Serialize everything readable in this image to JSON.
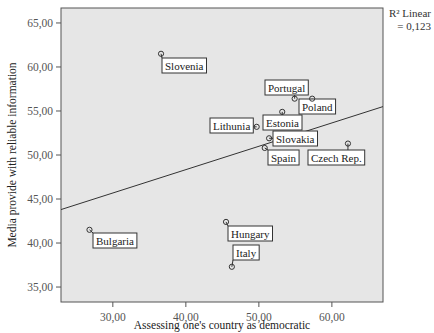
{
  "chart_data": {
    "type": "scatter",
    "title": "",
    "xlabel": "Assessing one's country as democratic",
    "ylabel": "Media provide with reliable information",
    "xlim": [
      22.9,
      67.0
    ],
    "ylim": [
      33.3,
      66.7
    ],
    "x_ticks": [
      30,
      40,
      50,
      60
    ],
    "x_tick_labels": [
      "30,00",
      "40,00",
      "50,00",
      "60,00"
    ],
    "y_ticks": [
      35,
      40,
      45,
      50,
      55,
      60,
      65
    ],
    "y_tick_labels": [
      "35,00",
      "40,00",
      "45,00",
      "50,00",
      "55,00",
      "60,00",
      "65,00"
    ],
    "grid": false,
    "background": "#e6e6e6",
    "points": [
      {
        "label": "Slovenia",
        "x": 36.6,
        "y": 61.5,
        "lx": 162,
        "ly": 58,
        "anchor": "tl"
      },
      {
        "label": "Portugal",
        "x": 54.9,
        "y": 56.4,
        "lx": 265,
        "ly": 80,
        "anchor": "tl"
      },
      {
        "label": "Poland",
        "x": 57.3,
        "y": 56.4,
        "lx": 299,
        "ly": 99,
        "anchor": "tl"
      },
      {
        "label": "Estonia",
        "x": 53.2,
        "y": 54.9,
        "lx": 263,
        "ly": 115,
        "anchor": "tl"
      },
      {
        "label": "Lithunia",
        "x": 49.7,
        "y": 53.2,
        "lx": 210,
        "ly": 118,
        "anchor": "tl"
      },
      {
        "label": "Slovakia",
        "x": 51.4,
        "y": 51.9,
        "lx": 273,
        "ly": 131,
        "anchor": "tl"
      },
      {
        "label": "Spain",
        "x": 50.8,
        "y": 50.8,
        "lx": 268,
        "ly": 150,
        "anchor": "tl"
      },
      {
        "label": "Czech Rep.",
        "x": 62.2,
        "y": 51.3,
        "lx": 308,
        "ly": 150,
        "anchor": "tl"
      },
      {
        "label": "Bulgaria",
        "x": 26.8,
        "y": 41.5,
        "lx": 93,
        "ly": 233,
        "anchor": "tl"
      },
      {
        "label": "Hungary",
        "x": 45.5,
        "y": 42.4,
        "lx": 228,
        "ly": 226,
        "anchor": "tl"
      },
      {
        "label": "Italy",
        "x": 46.3,
        "y": 37.3,
        "lx": 233,
        "ly": 245,
        "anchor": "tl"
      }
    ],
    "fit_line": {
      "type": "linear",
      "x": [
        22.9,
        67.0
      ],
      "y": [
        43.8,
        55.5
      ]
    },
    "annotation": {
      "line1": "R² Linear",
      "line2": "= 0,123"
    }
  }
}
